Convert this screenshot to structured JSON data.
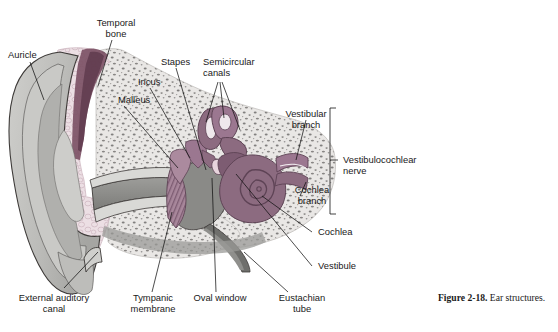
{
  "figure": {
    "caption_number": "Figure 2-18.",
    "caption_text": " Ear structures."
  },
  "labels": {
    "auricle": "Auricle",
    "temporal_bone_l1": "Temporal",
    "temporal_bone_l2": "bone",
    "malleus": "Malleus",
    "incus": "Incus",
    "stapes": "Stapes",
    "semicircular_l1": "Semicircular",
    "semicircular_l2": "canals",
    "vestibular_branch_l1": "Vestibular",
    "vestibular_branch_l2": "branch",
    "cochlea_branch_l1": "Cochlea",
    "cochlea_branch_l2": "branch",
    "vestibulocochlear_l1": "Vestibulocochlear",
    "vestibulocochlear_l2": "nerve",
    "cochlea": "Cochlea",
    "vestibule": "Vestibule",
    "external_auditory_l1": "External auditory",
    "external_auditory_l2": "canal",
    "tympanic_l1": "Tympanic",
    "tympanic_l2": "membrane",
    "oval_window": "Oval window",
    "eustachian_l1": "Eustachian",
    "eustachian_l2": "tube"
  },
  "colors": {
    "background": "#ffffff",
    "text": "#1a1a1a",
    "leader_line": "#111111",
    "auricle_light": "#d6d6d4",
    "auricle_mid": "#b9b9b6",
    "auricle_dark": "#9a9a97",
    "cartilage_pink": "#ecdfe4",
    "bone_stipple_bg": "#e9e7e5",
    "bone_stipple_dot": "#6f6d6c",
    "cochlea_mauve": "#8c6b80",
    "cochlea_mauve_dark": "#6f5166",
    "cochlea_mauve_light": "#ab8a9e",
    "canal_gray": "#868683",
    "outline": "#3d3a38"
  }
}
